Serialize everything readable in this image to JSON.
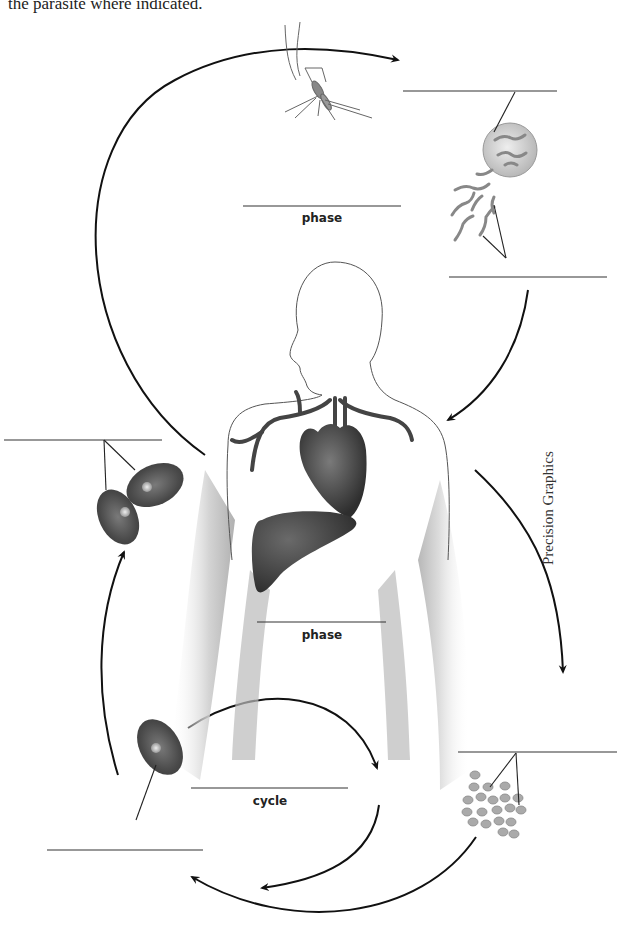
{
  "instruction": "the parasite where indicated.",
  "credit": "Precision Graphics",
  "labels": {
    "mosquito_phase": "phase",
    "human_phase": "phase",
    "cycle": "cycle"
  },
  "blanks": [
    {
      "id": "sporozoite-top",
      "value": ""
    },
    {
      "id": "mosquito-phase",
      "value": ""
    },
    {
      "id": "sporozoites-right",
      "value": ""
    },
    {
      "id": "infected-rbc-left",
      "value": ""
    },
    {
      "id": "liver-phase",
      "value": ""
    },
    {
      "id": "merozoites-right",
      "value": ""
    },
    {
      "id": "cycle-blank",
      "value": ""
    },
    {
      "id": "single-rbc-bottom-left",
      "value": ""
    }
  ],
  "colors": {
    "line": "#333333",
    "organ": "#3a3a3a",
    "rbc": "#4a4a4a",
    "parasite": "#9a9a9a",
    "skin_shade": "#c8c8c8"
  }
}
